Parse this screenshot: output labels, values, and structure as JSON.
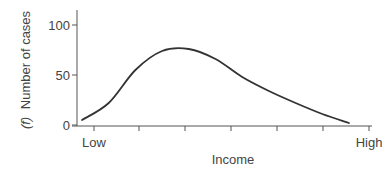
{
  "chart_data": {
    "type": "line",
    "title": "",
    "xlabel": "Income",
    "ylabel": "(f) Number of cases",
    "ylabel_italic_prefix": "(f)",
    "ylabel_text": "Number of cases",
    "ylim": [
      0,
      120
    ],
    "yticks": [
      0,
      50,
      100
    ],
    "xtick_labels": {
      "start": "Low",
      "end": "High"
    },
    "x_tick_count": 7,
    "grid": false,
    "legend": null,
    "series": [
      {
        "name": "Income distribution",
        "x": [
          0,
          0.1,
          0.2,
          0.3,
          0.4,
          0.5,
          0.6,
          0.7,
          0.8,
          0.9,
          1.0
        ],
        "values": [
          5,
          22,
          55,
          74,
          76,
          66,
          48,
          34,
          22,
          11,
          2
        ]
      }
    ],
    "colors": {
      "line": "#333333",
      "axis": "#555555"
    }
  }
}
